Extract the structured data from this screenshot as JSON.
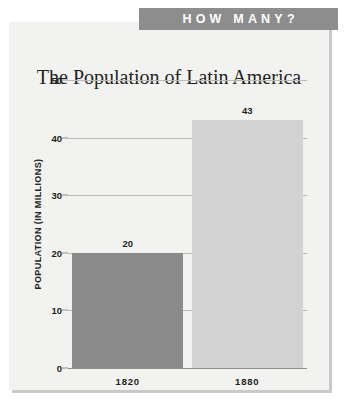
{
  "banner": {
    "label": "HOW MANY?",
    "background_color": "#8d8d8d",
    "text_color": "#ffffff"
  },
  "card": {
    "background_color": "#f2f2f0",
    "shadow_color": "#c9c9c7"
  },
  "chart_data": {
    "type": "bar",
    "title": "The Population of Latin America",
    "xlabel": "",
    "ylabel": "POPULATION (IN MILLIONS)",
    "categories": [
      "1820",
      "1880"
    ],
    "values": [
      20,
      43
    ],
    "value_labels": [
      "20",
      "43"
    ],
    "bar_colors": [
      "#8a8a8a",
      "#d2d2d2"
    ],
    "ylim": [
      0,
      50
    ],
    "yticks": [
      0,
      10,
      20,
      30,
      40,
      50
    ],
    "ytick_labels": [
      "0",
      "10",
      "20",
      "30",
      "40",
      "50"
    ],
    "grid": true,
    "grid_color": "#b9b9b7",
    "legend": false,
    "legend_position": "none",
    "axis_color": "#8f8f8d",
    "text_color": "#231f20"
  }
}
